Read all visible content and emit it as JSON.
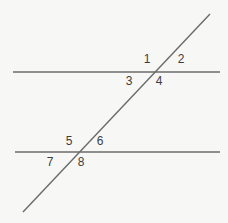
{
  "figure": {
    "name": "parallel-lines-transversal-diagram",
    "background_color": "#f7f7f5",
    "line_color": "#6b6b6b",
    "label_color": "#3d3d3d",
    "width": 228,
    "height": 223
  },
  "lines": {
    "top_parallel": {
      "name": "top-parallel-line",
      "x1": 13,
      "y1": 72,
      "x2": 220,
      "y2": 72,
      "stroke_width": 1.4
    },
    "bottom_parallel": {
      "name": "bottom-parallel-line",
      "x1": 15,
      "y1": 152,
      "x2": 220,
      "y2": 152,
      "stroke_width": 1.4
    },
    "transversal": {
      "name": "transversal-line",
      "x1": 23,
      "y1": 212,
      "x2": 210,
      "y2": 14,
      "stroke_width": 1.4
    }
  },
  "intersections": {
    "upper": {
      "x": 155,
      "y": 72
    },
    "lower": {
      "x": 76,
      "y": 152
    }
  },
  "labels": [
    {
      "id": "angle-1",
      "text": "1",
      "x": 147,
      "y": 59
    },
    {
      "id": "angle-2",
      "text": "2",
      "x": 181,
      "y": 59
    },
    {
      "id": "angle-3",
      "text": "3",
      "x": 129,
      "y": 81
    },
    {
      "id": "angle-4",
      "text": "4",
      "x": 159,
      "y": 81
    },
    {
      "id": "angle-5",
      "text": "5",
      "x": 69,
      "y": 141
    },
    {
      "id": "angle-6",
      "text": "6",
      "x": 100,
      "y": 141
    },
    {
      "id": "angle-7",
      "text": "7",
      "x": 50,
      "y": 162
    },
    {
      "id": "angle-8",
      "text": "8",
      "x": 81,
      "y": 162
    }
  ]
}
